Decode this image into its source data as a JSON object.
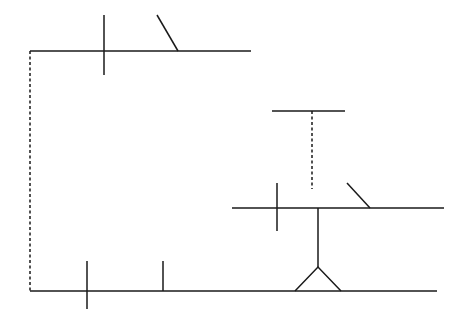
{
  "diagram": {
    "type": "line-schematic",
    "background": "#ffffff",
    "stroke_color": "#1a1a1a",
    "elements": [
      {
        "name": "top-line",
        "kind": "solid",
        "x1": 30,
        "y1": 51,
        "x2": 251,
        "y2": 51
      },
      {
        "name": "top-cross-tick",
        "kind": "solid",
        "x1": 104,
        "y1": 15,
        "x2": 104,
        "y2": 75
      },
      {
        "name": "top-diagonal",
        "kind": "solid",
        "x1": 157,
        "y1": 15,
        "x2": 178,
        "y2": 51
      },
      {
        "name": "left-dashed-connector",
        "kind": "dashed",
        "x1": 30,
        "y1": 51,
        "x2": 30,
        "y2": 291
      },
      {
        "name": "bottom-line",
        "kind": "solid",
        "x1": 30,
        "y1": 291,
        "x2": 437,
        "y2": 291
      },
      {
        "name": "bottom-cross-tick",
        "kind": "solid",
        "x1": 87,
        "y1": 261,
        "x2": 87,
        "y2": 309
      },
      {
        "name": "bottom-up-tick",
        "kind": "solid",
        "x1": 163,
        "y1": 261,
        "x2": 163,
        "y2": 291
      },
      {
        "name": "middle-line",
        "kind": "solid",
        "x1": 232,
        "y1": 208,
        "x2": 444,
        "y2": 208
      },
      {
        "name": "middle-cross-tick",
        "kind": "solid",
        "x1": 277,
        "y1": 183,
        "x2": 277,
        "y2": 231
      },
      {
        "name": "middle-diagonal",
        "kind": "solid",
        "x1": 347,
        "y1": 183,
        "x2": 370,
        "y2": 208
      },
      {
        "name": "stem-line",
        "kind": "solid",
        "x1": 318,
        "y1": 208,
        "x2": 318,
        "y2": 267
      },
      {
        "name": "top-right-bar",
        "kind": "solid",
        "x1": 272,
        "y1": 111,
        "x2": 345,
        "y2": 111
      },
      {
        "name": "top-right-dashed-connector",
        "kind": "dashed",
        "x1": 312,
        "y1": 111,
        "x2": 312,
        "y2": 189
      }
    ],
    "triangle": {
      "apex": [
        318,
        267
      ],
      "base_left": [
        295,
        291
      ],
      "base_right": [
        341,
        291
      ]
    }
  }
}
